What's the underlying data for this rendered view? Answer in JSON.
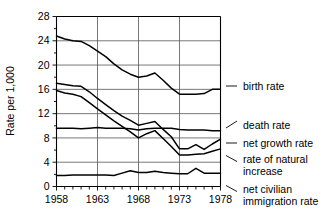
{
  "chart_data": {
    "type": "line",
    "title": "",
    "xlabel": "",
    "ylabel": "Rate per 1,000",
    "xlim": [
      1958,
      1978
    ],
    "ylim": [
      0,
      28
    ],
    "ytick_step": 4,
    "yticks": [
      0,
      4,
      8,
      12,
      16,
      20,
      24,
      28
    ],
    "ytick_labels": [
      "0",
      "4",
      "8",
      "12",
      "16",
      "20",
      "24",
      "28"
    ],
    "xticks": [
      1958,
      1963,
      1968,
      1973,
      1978
    ],
    "xtick_labels": [
      "1958",
      "1963",
      "1968",
      "1973",
      "1978"
    ],
    "x_minor_ticks_every": 1,
    "grid": "both",
    "grid_x_at": [
      1963,
      1968,
      1973
    ],
    "legend_position": "right-outside",
    "x": [
      1958,
      1959,
      1960,
      1961,
      1962,
      1963,
      1964,
      1965,
      1966,
      1967,
      1968,
      1969,
      1970,
      1971,
      1972,
      1973,
      1974,
      1975,
      1976,
      1977,
      1978
    ],
    "series": [
      {
        "name": "birth rate",
        "label": "birth rate",
        "values": [
          24.8,
          24.3,
          24.0,
          23.9,
          23.2,
          22.3,
          21.4,
          20.2,
          19.2,
          18.5,
          18.0,
          18.2,
          18.7,
          17.5,
          16.2,
          15.2,
          15.2,
          15.2,
          15.3,
          16.0,
          16.0
        ]
      },
      {
        "name": "death rate",
        "label": "death rate",
        "values": [
          9.6,
          9.6,
          9.6,
          9.5,
          9.6,
          9.7,
          9.6,
          9.6,
          9.6,
          9.5,
          9.3,
          9.5,
          9.6,
          9.6,
          9.6,
          9.4,
          9.3,
          9.3,
          9.3,
          9.2,
          9.2
        ]
      },
      {
        "name": "net growth rate",
        "label": "net growth rate",
        "values": [
          17.0,
          16.8,
          16.6,
          16.5,
          15.6,
          14.5,
          13.5,
          12.5,
          11.6,
          10.9,
          10.1,
          10.4,
          10.7,
          9.4,
          8.2,
          6.2,
          6.2,
          6.9,
          6.1,
          7.0,
          7.8
        ]
      },
      {
        "name": "rate of natural increase",
        "label": "rate of natural increase",
        "values": [
          15.8,
          15.4,
          15.2,
          14.8,
          13.8,
          12.8,
          11.8,
          10.8,
          9.9,
          9.0,
          8.0,
          8.7,
          9.2,
          7.9,
          6.6,
          5.2,
          5.2,
          5.3,
          5.4,
          5.8,
          6.2
        ]
      },
      {
        "name": "net civilian immigration rate",
        "label": "net civilian immigration rate",
        "values": [
          1.8,
          1.8,
          1.9,
          1.9,
          1.9,
          1.9,
          1.9,
          1.8,
          2.2,
          2.6,
          2.3,
          2.3,
          2.5,
          2.3,
          2.2,
          2.1,
          2.1,
          3.0,
          2.2,
          2.2,
          2.2
        ]
      }
    ],
    "legend_entries": [
      {
        "label": "birth rate",
        "connector": "dash",
        "anchor_value": 16.0
      },
      {
        "label": "death rate",
        "connector": "slash-up",
        "anchor_value": 9.2
      },
      {
        "label": "net growth rate",
        "connector": "dash",
        "anchor_value": 7.8
      },
      {
        "label": "rate of natural increase",
        "connector": "slash-down",
        "anchor_value": 6.2
      },
      {
        "label": "net civilian immigration rate",
        "connector": "slash-down",
        "anchor_value": 2.2
      }
    ],
    "legend_lines": {
      "birth_rate": [
        "birth rate"
      ],
      "death_rate": [
        "death rate"
      ],
      "net_growth_rate": [
        "net growth rate"
      ],
      "rate_of_natural_increase": [
        "rate of natural",
        "increase"
      ],
      "net_civilian_immigration_rate": [
        "net civilian",
        "immigration rate"
      ]
    },
    "colors": {
      "line": "#000000",
      "grid": "#555555",
      "axis": "#000000",
      "background": "#ffffff"
    }
  }
}
